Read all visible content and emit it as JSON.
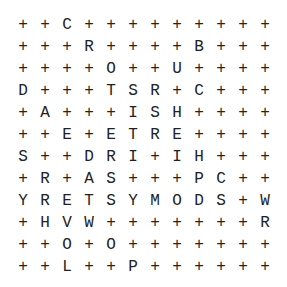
{
  "puzzle": {
    "type": "word-search",
    "rows": 12,
    "cols": 12,
    "filler": "+",
    "grid": [
      [
        "+",
        "+",
        "C",
        "+",
        "+",
        "+",
        "+",
        "+",
        "+",
        "+",
        "+",
        "+"
      ],
      [
        "+",
        "+",
        "+",
        "R",
        "+",
        "+",
        "+",
        "+",
        "B",
        "+",
        "+",
        "+"
      ],
      [
        "+",
        "+",
        "+",
        "+",
        "O",
        "+",
        "+",
        "U",
        "+",
        "+",
        "+",
        "+"
      ],
      [
        "D",
        "+",
        "+",
        "+",
        "T",
        "S",
        "R",
        "+",
        "C",
        "+",
        "+",
        "+"
      ],
      [
        "+",
        "A",
        "+",
        "+",
        "+",
        "I",
        "S",
        "H",
        "+",
        "+",
        "+",
        "+"
      ],
      [
        "+",
        "+",
        "E",
        "+",
        "E",
        "T",
        "R",
        "E",
        "+",
        "+",
        "+",
        "+"
      ],
      [
        "S",
        "+",
        "+",
        "D",
        "R",
        "I",
        "+",
        "I",
        "H",
        "+",
        "+",
        "+"
      ],
      [
        "+",
        "R",
        "+",
        "A",
        "S",
        "+",
        "+",
        "+",
        "P",
        "C",
        "+",
        "+"
      ],
      [
        "Y",
        "R",
        "E",
        "T",
        "S",
        "Y",
        "M",
        "O",
        "D",
        "S",
        "+",
        "W"
      ],
      [
        "+",
        "H",
        "V",
        "W",
        "+",
        "+",
        "+",
        "+",
        "+",
        "+",
        "+",
        "R"
      ],
      [
        "+",
        "+",
        "O",
        "+",
        "O",
        "+",
        "+",
        "+",
        "+",
        "+",
        "+",
        "+"
      ],
      [
        "+",
        "+",
        "L",
        "+",
        "+",
        "P",
        "+",
        "+",
        "+",
        "+",
        "+",
        "+"
      ]
    ]
  }
}
